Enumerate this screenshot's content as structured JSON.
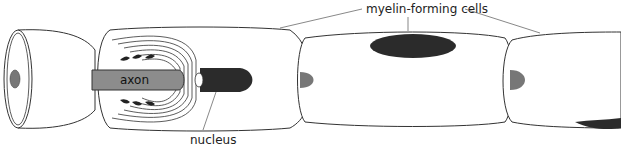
{
  "figure": {
    "type": "biological diagram"
  },
  "labels": {
    "myelin_forming_cells": "myelin-forming cells",
    "axon": "axon",
    "nucleus": "nucleus"
  },
  "colors": {
    "outline": "#333333",
    "cell_fill": "#ffffff",
    "axon_fill": "#8c8c8c",
    "nucleus_fill": "#2b2b2b",
    "axon_end_fill": "#777777"
  }
}
